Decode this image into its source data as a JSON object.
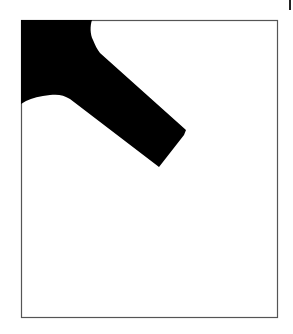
{
  "figure": {
    "colors": {
      "shape_fill": "#000000",
      "frame_stroke": "#555555",
      "background": "#ffffff",
      "tick_mark": "#222222"
    },
    "frame": {
      "x": 21,
      "y": 20,
      "width": 256,
      "height": 297
    },
    "shape_path": "M21,20 L92,20 C90,26 90,34 93,40 C95,45 97,49 100,53 L186,130 L184,135 L159,167 L70,99 C64,95 58,94 50,95 C40,96 32,98 26,101 L21,104 Z",
    "tick": {
      "x": 289,
      "y": 0,
      "width": 2,
      "height": 10
    }
  }
}
